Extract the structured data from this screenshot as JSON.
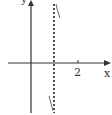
{
  "diagram": {
    "type": "function-graph",
    "axes": {
      "x_label": "x",
      "y_label": "y",
      "x_tick_label": "2"
    },
    "asymptote": {
      "style": "dashed",
      "orientation": "vertical"
    },
    "colors": {
      "axis": "#333333",
      "curve": "#666666",
      "asymptote": "#222222",
      "background": "#ffffff"
    }
  }
}
